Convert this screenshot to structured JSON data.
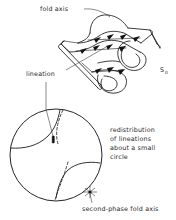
{
  "figure": {
    "title": "Redistribution of lineations about a small circle",
    "type": "structural-geology-diagram",
    "background_color": "#ffffff",
    "line_color": "#1a1a1a",
    "text_color": "#2b2b2b"
  },
  "labels": {
    "fold_axis": "fold axis",
    "lineation": "lineation",
    "bedding_symbol": "S",
    "bedding_subscript": "0",
    "caption_line1": "redistribution",
    "caption_line2": "of lineations",
    "caption_line3": "about a small",
    "caption_line4": "circle",
    "second_phase_fold_axis": "second-phase fold axis"
  },
  "upper_block": {
    "name": "folded-surface-block",
    "description": "Three-dimensional sketch of a folded layer showing an antiform and synform hinge with lineation chevrons on the upper surface",
    "annotations": [
      {
        "name": "fold-axis-leader",
        "target": "antiform hinge crest"
      },
      {
        "name": "lineation-leader",
        "target": "chevron lineation on fold limb"
      },
      {
        "name": "bedding-leader",
        "target": "layer edge at right"
      }
    ],
    "chevron_count": 11
  },
  "stereonet": {
    "name": "lower-hemisphere-stereonet",
    "center": {
      "x": 56,
      "y": 155
    },
    "radius": 46,
    "elements": [
      {
        "name": "primitive-circle",
        "style": "solid"
      },
      {
        "name": "small-circle-upper",
        "style": "dashed"
      },
      {
        "name": "small-circle-lower",
        "style": "dashed"
      },
      {
        "name": "girdle-arc-upper-left",
        "style": "solid"
      },
      {
        "name": "girdle-arc-lower-right",
        "style": "solid"
      },
      {
        "name": "lineation-point",
        "style": "filled-tick"
      },
      {
        "name": "second-phase-fold-axis-point",
        "style": "star"
      }
    ]
  }
}
